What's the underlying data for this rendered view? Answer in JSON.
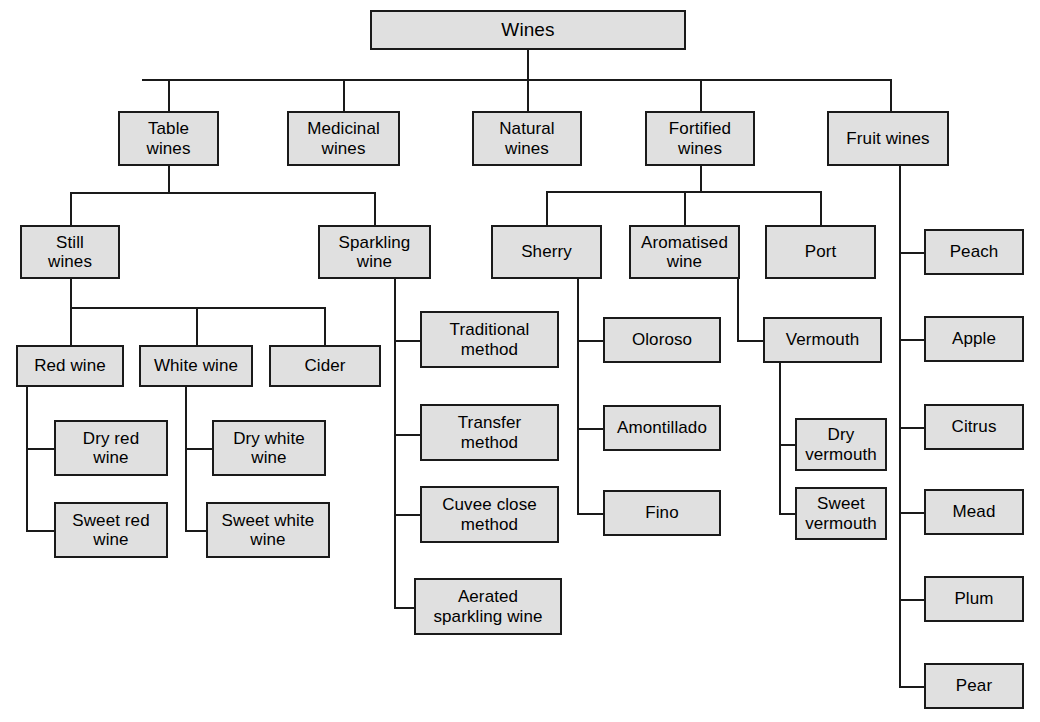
{
  "diagram": {
    "title": "Wines",
    "type": "hierarchy-tree",
    "orientation": "top-down-with-vertical-spines",
    "style": {
      "node_fill": "#e0e0e0",
      "node_border": "#1a1a1a",
      "line_color": "#1a1a1a",
      "background": "#ffffff",
      "text_color": "#000000"
    },
    "nodes": {
      "root": "Wines",
      "level1": [
        "Table\nwines",
        "Medicinal\nwines",
        "Natural\nwines",
        "Fortified\nwines",
        "Fruit wines"
      ],
      "table_children": [
        "Still\nwines",
        "Sparkling\nwine"
      ],
      "still_children": [
        "Red wine",
        "White wine",
        "Cider"
      ],
      "red_children": [
        "Dry red\nwine",
        "Sweet red\nwine"
      ],
      "white_children": [
        "Dry white\nwine",
        "Sweet white\nwine"
      ],
      "sparkling_children": [
        "Traditional\nmethod",
        "Transfer\nmethod",
        "Cuvee close\nmethod",
        "Aerated\nsparkling wine"
      ],
      "fortified_children": [
        "Sherry",
        "Aromatised\nwine",
        "Port"
      ],
      "sherry_children": [
        "Oloroso",
        "Amontillado",
        "Fino"
      ],
      "aromatised_children": [
        "Vermouth"
      ],
      "vermouth_children": [
        "Dry\nvermouth",
        "Sweet\nvermouth"
      ],
      "fruit_children": [
        "Peach",
        "Apple",
        "Citrus",
        "Mead",
        "Plum",
        "Pear"
      ]
    }
  }
}
